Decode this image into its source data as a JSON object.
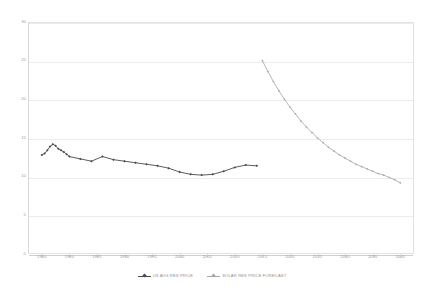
{
  "chart_data": {
    "type": "line",
    "title": "",
    "subtitle": "",
    "xlabel": "",
    "ylabel": "",
    "xlim": [
      1960,
      2040
    ],
    "ylim": [
      0,
      30
    ],
    "grid": true,
    "legend_position": "bottom",
    "y_ticks": [
      "0",
      "5",
      "10",
      "15",
      "20",
      "25",
      "30"
    ],
    "y_tick_values": [
      0,
      5,
      10,
      15,
      20,
      25,
      30
    ],
    "x_ticks": [
      "1960",
      "1980",
      "1985",
      "1990",
      "1995",
      "2000",
      "2005",
      "2010",
      "2015",
      "2020",
      "2025",
      "2030",
      "2035",
      "2040"
    ],
    "x_tick_values": [
      1960,
      1980,
      1985,
      1990,
      1995,
      2000,
      2005,
      2010,
      2015,
      2020,
      2025,
      2030,
      2035,
      2040
    ],
    "series": [
      {
        "name": "US AVG RES PRICE",
        "color": "#4a4a4a",
        "marker": "diamond",
        "x": [
          1960,
          1962,
          1964,
          1966,
          1968,
          1970,
          1972,
          1974,
          1976,
          1978,
          1980,
          1982,
          1984,
          1986,
          1988,
          1990,
          1992,
          1994,
          1996,
          1998,
          2000,
          2002,
          2004,
          2006,
          2008,
          2010,
          2012,
          2014
        ],
        "values": [
          12.8,
          13.0,
          13.4,
          13.9,
          14.2,
          14.0,
          13.6,
          13.4,
          13.2,
          12.9,
          12.6,
          12.3,
          12.0,
          12.6,
          12.2,
          12.0,
          11.8,
          11.6,
          11.4,
          11.1,
          10.6,
          10.3,
          10.2,
          10.3,
          10.7,
          11.2,
          11.5,
          11.4
        ]
      },
      {
        "name": "SOLAR RES PRICE FORECAST",
        "color": "#a8a8a8",
        "marker": "diamond",
        "x": [
          2015,
          2016,
          2017,
          2018,
          2019,
          2020,
          2021,
          2022,
          2023,
          2024,
          2025,
          2026,
          2027,
          2028,
          2029,
          2030,
          2031,
          2032,
          2033,
          2034,
          2035,
          2036,
          2037,
          2038,
          2039,
          2040
        ],
        "values": [
          25.0,
          23.6,
          22.3,
          21.1,
          20.0,
          19.0,
          18.1,
          17.2,
          16.4,
          15.7,
          15.0,
          14.4,
          13.8,
          13.3,
          12.8,
          12.4,
          12.0,
          11.6,
          11.3,
          11.0,
          10.7,
          10.4,
          10.2,
          9.9,
          9.6,
          9.2
        ]
      }
    ]
  },
  "legend": {
    "items": [
      {
        "label": "US AVG RES PRICE",
        "color": "#4a4a4a"
      },
      {
        "label": "SOLAR RES PRICE FORECAST",
        "color": "#a8a8a8"
      }
    ]
  },
  "colors": {
    "background": "#ffffff",
    "grid": "#ececec",
    "frame": "#e2e2e2",
    "axis_text": "#9a9a9a",
    "series_primary": "#4a4a4a",
    "series_forecast": "#a8a8a8"
  }
}
